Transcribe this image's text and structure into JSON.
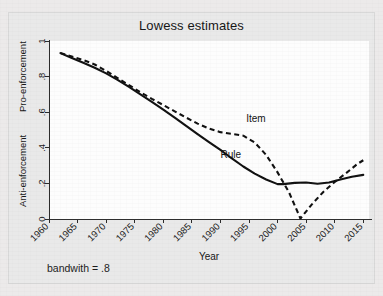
{
  "figure": {
    "title": "Lowess estimates",
    "footnote": "bandwith = .8",
    "background_color": "#eceaea",
    "panel_color": "#fdfdfd",
    "line_color": "#101010"
  },
  "chart_data": {
    "type": "line",
    "title": "Lowess estimates",
    "subtitle": "",
    "xlabel": "Year",
    "ylabel": "",
    "y_axis_region_labels": [
      "Pro-enforcement",
      "Anti-enforcement"
    ],
    "annotations": [
      {
        "text": "Item",
        "x": 1994.5,
        "y": 0.545
      },
      {
        "text": "Rule",
        "x": 1990.0,
        "y": 0.345
      },
      {
        "text": "bandwith = .8",
        "x": null,
        "y": null
      }
    ],
    "xlim": [
      1960,
      2016
    ],
    "ylim": [
      0,
      1
    ],
    "xticks": [
      1960,
      1965,
      1970,
      1975,
      1980,
      1985,
      1990,
      1995,
      2000,
      2005,
      2010,
      2015
    ],
    "xtick_labels": [
      "1960",
      "1965",
      "1970",
      "1975",
      "1980",
      "1985",
      "1990",
      "1995",
      "2000",
      "2005",
      "2010",
      "2015"
    ],
    "xtick_rotation_deg": 45,
    "yticks": [
      0,
      0.2,
      0.4,
      0.6,
      0.8,
      1
    ],
    "ytick_labels": [
      "0",
      ".2",
      ".4",
      ".6",
      ".8",
      "1"
    ],
    "grid": false,
    "legend": "inline-labels",
    "series": [
      {
        "name": "Rule",
        "style": "solid",
        "x": [
          1962,
          1964,
          1966,
          1968,
          1970,
          1972,
          1974,
          1976,
          1978,
          1980,
          1982,
          1984,
          1986,
          1988,
          1990,
          1992,
          1994,
          1996,
          1998,
          2000,
          2001,
          2003,
          2005,
          2007,
          2009,
          2011,
          2013,
          2015
        ],
        "y": [
          0.932,
          0.905,
          0.878,
          0.85,
          0.818,
          0.782,
          0.742,
          0.7,
          0.658,
          0.615,
          0.57,
          0.523,
          0.477,
          0.432,
          0.388,
          0.34,
          0.295,
          0.255,
          0.222,
          0.196,
          0.196,
          0.203,
          0.205,
          0.198,
          0.205,
          0.222,
          0.237,
          0.248
        ]
      },
      {
        "name": "Item",
        "style": "dashed",
        "x": [
          1962,
          1964,
          1966,
          1968,
          1970,
          1972,
          1974,
          1976,
          1978,
          1980,
          1982,
          1984,
          1986,
          1988,
          1990,
          1992,
          1994,
          1996,
          1998,
          2000,
          2002,
          2004,
          2006,
          2008,
          2010,
          2012,
          2014,
          2015
        ],
        "y": [
          0.932,
          0.913,
          0.893,
          0.868,
          0.832,
          0.792,
          0.752,
          0.712,
          0.675,
          0.64,
          0.605,
          0.57,
          0.536,
          0.508,
          0.488,
          0.478,
          0.468,
          0.43,
          0.36,
          0.262,
          0.15,
          0.003,
          0.082,
          0.152,
          0.208,
          0.258,
          0.31,
          0.33
        ]
      }
    ]
  }
}
